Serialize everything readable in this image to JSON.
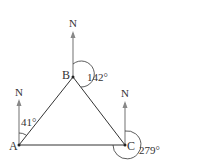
{
  "points": {
    "A": {
      "label": "A",
      "x": 19,
      "y": 145
    },
    "B": {
      "label": "B",
      "x": 73,
      "y": 77
    },
    "C": {
      "label": "C",
      "x": 125,
      "y": 145
    }
  },
  "north_label": "N",
  "bearings": {
    "A": "41°",
    "B": "142°",
    "C": "279°"
  },
  "colors": {
    "line": "#333333",
    "north": "#888888"
  }
}
